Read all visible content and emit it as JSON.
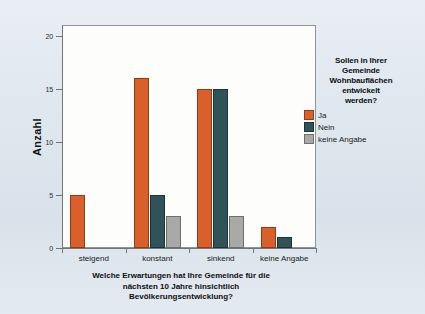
{
  "chart_data": {
    "type": "bar",
    "title": "",
    "subtitle": "",
    "xlabel": "Welche Erwartungen hat Ihre Gemeinde für die nächsten 10 Jahre hinsichtlich Bevölkerungsentwicklung?",
    "ylabel": "Anzahl",
    "ylim": [
      0,
      21
    ],
    "yticks": [
      0,
      5,
      10,
      15,
      20
    ],
    "ytick_labels": [
      "0",
      "5",
      "10",
      "15",
      "20"
    ],
    "grid": false,
    "legend_position": "right",
    "legend_title": "Sollen in Ihrer Gemeinde Wohnbauflächen entwickelt werden?",
    "categories": [
      "steigend",
      "konstant",
      "sinkend",
      "keine Angabe"
    ],
    "series": [
      {
        "name": "Ja",
        "color": "#d95f2b",
        "values": [
          5,
          16,
          15,
          2
        ]
      },
      {
        "name": "Nein",
        "color": "#2f5358",
        "values": [
          0,
          5,
          15,
          1
        ]
      },
      {
        "name": "keine Angabe",
        "color": "#a9a9a7",
        "values": [
          0,
          3,
          3,
          0
        ]
      }
    ]
  },
  "axis": {
    "y_title": "Anzahl",
    "y_ticks": [
      "20",
      "15",
      "10",
      "5",
      "0"
    ],
    "x_ticks": [
      "steigend",
      "konstant",
      "sinkend",
      "keine Angabe"
    ],
    "x_title_line1": "Welche Erwartungen hat Ihre Gemeinde für die",
    "x_title_line2": "nächsten 10 Jahre hinsichtlich",
    "x_title_line3": "Bevölkerungsentwicklung?"
  },
  "legend": {
    "title_line1": "Sollen in Ihrer",
    "title_line2": "Gemeinde",
    "title_line3": "Wohnbauflächen",
    "title_line4": "entwickelt",
    "title_line5": "werden?",
    "entries": [
      {
        "label": "Ja",
        "color": "#d95f2b"
      },
      {
        "label": "Nein",
        "color": "#2f5358"
      },
      {
        "label": "keine Angabe",
        "color": "#a9a9a7"
      }
    ]
  },
  "colors": {
    "background": "#dde5ed",
    "plot_background": "#fdfdfc",
    "axis": "#6f7579",
    "ja": "#d95f2b",
    "nein": "#2f5358",
    "keine_angabe": "#a9a9a7"
  }
}
